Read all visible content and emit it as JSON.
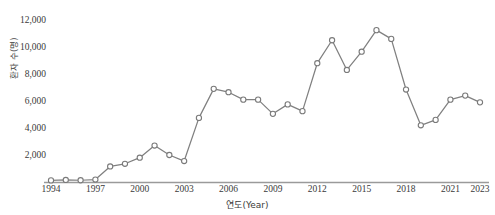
{
  "chart_data": {
    "type": "line",
    "title": "",
    "xlabel": "연도(Year)",
    "ylabel": "환자 수(명)",
    "x": [
      1994,
      1995,
      1996,
      1997,
      1998,
      1999,
      2000,
      2001,
      2002,
      2003,
      2004,
      2005,
      2006,
      2007,
      2008,
      2009,
      2010,
      2011,
      2012,
      2013,
      2014,
      2015,
      2016,
      2017,
      2018,
      2019,
      2020,
      2021,
      2022,
      2023
    ],
    "values": [
      120,
      150,
      130,
      180,
      1150,
      1350,
      1800,
      2700,
      2000,
      1550,
      4750,
      6900,
      6650,
      6100,
      6100,
      5050,
      5750,
      5250,
      8800,
      10500,
      8300,
      9650,
      11250,
      10600,
      6850,
      4200,
      4600,
      6100,
      6400,
      5900
    ],
    "series": [
      {
        "name": "환자 수(명)",
        "values": [
          120,
          150,
          130,
          180,
          1150,
          1350,
          1800,
          2700,
          2000,
          1550,
          4750,
          6900,
          6650,
          6100,
          6100,
          5050,
          5750,
          5250,
          8800,
          10500,
          8300,
          9650,
          11250,
          10600,
          6850,
          4200,
          4600,
          6100,
          6400,
          5900
        ]
      }
    ],
    "ylim": [
      0,
      12000
    ],
    "xlim": [
      1994,
      2023
    ],
    "ytick_labels": [
      "12,000",
      "10,000",
      "8,000",
      "6,000",
      "4,000",
      "2,000"
    ],
    "ytick_values": [
      12000,
      10000,
      8000,
      6000,
      4000,
      2000
    ],
    "xtick_labels": [
      "1994",
      "1997",
      "2000",
      "2003",
      "2006",
      "2009",
      "2012",
      "2015",
      "2018",
      "2021",
      "2023"
    ],
    "xtick_values": [
      1994,
      1997,
      2000,
      2003,
      2006,
      2009,
      2012,
      2015,
      2018,
      2021,
      2023
    ],
    "grid": false,
    "legend": "none",
    "marker": "circle-open",
    "line_color": "#808080",
    "marker_face_color": "#ffffff",
    "marker_edge_color": "#7a7a7a",
    "axis_color": "#9a9a9a",
    "text_color": "#3a3a3a"
  }
}
